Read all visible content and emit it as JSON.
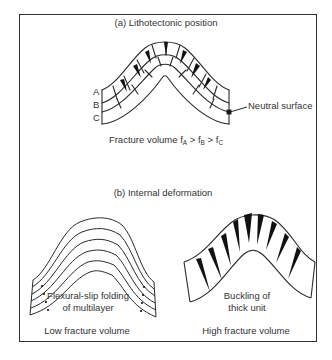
{
  "figure": {
    "panel_a": {
      "title": "(a) Lithotectonic position",
      "layer_labels": [
        "A",
        "B",
        "C"
      ],
      "neutral_surface_label": "Neutral surface",
      "fracture_caption": {
        "prefix": "Fracture volume ",
        "f": "f",
        "gt": " > ",
        "sub_a": "A",
        "sub_b": "B",
        "sub_c": "C"
      }
    },
    "panel_b": {
      "title": "(b) Internal deformation",
      "left": {
        "caption_line1": "Flexural-slip folding",
        "caption_line2": "of multilayer",
        "volume_label": "Low fracture volume"
      },
      "right": {
        "caption_line1": "Buckling of",
        "caption_line2": "thick unit",
        "volume_label": "High fracture volume"
      }
    },
    "colors": {
      "line": "#2a2a2a",
      "frame": "#333333",
      "fracture_fill": "#111111",
      "background": "#ffffff"
    }
  }
}
